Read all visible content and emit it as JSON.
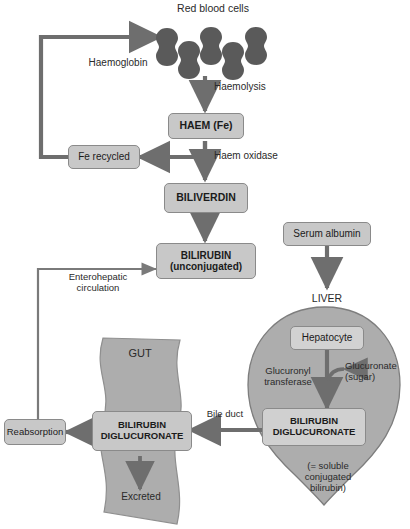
{
  "diagram": {
    "colors": {
      "background": "#ffffff",
      "box_fill": "#c8c8c8",
      "box_border": "#8a8a8a",
      "organ_fill": "#adadad",
      "organ_border": "#7d7d7d",
      "cell_fill": "#5a5a5a",
      "arrow": "#6e6e6e",
      "text": "#1b1b1b"
    },
    "cells": {
      "label": "Red blood cells",
      "count": 5,
      "icon": "red-blood-cell-icon"
    },
    "boxes": [
      {
        "id": "haem",
        "label": "HAEM (Fe)",
        "bold": true
      },
      {
        "id": "fe-recycled",
        "label": "Fe recycled",
        "bold": false
      },
      {
        "id": "biliverdin",
        "label": "BILIVERDIN",
        "bold": true
      },
      {
        "id": "bilirubin-unconjugated",
        "label": "BILIRUBIN\n(unconjugated)",
        "bold": true
      },
      {
        "id": "serum-albumin",
        "label": "Serum albumin",
        "bold": false
      },
      {
        "id": "hepatocyte",
        "label": "Hepatocyte",
        "bold": false
      },
      {
        "id": "bilirubin-diglucuronate-liver",
        "label": "BILIRUBIN\nDIGLUCURONATE",
        "bold": true
      },
      {
        "id": "bilirubin-diglucuronate-gut",
        "label": "BILIRUBIN\nDIGLUCURONATE",
        "bold": true
      },
      {
        "id": "reabsorption",
        "label": "Reabsorption",
        "bold": false
      }
    ],
    "labels": {
      "haemoglobin": "Haemoglobin",
      "haemolysis": "Haemolysis",
      "haem_oxidase": "Haem oxidase",
      "enterohepatic": "Enterohepatic\ncirculation",
      "liver": "LIVER",
      "gut": "GUT",
      "glucuronyl_transferase": "Glucuronyl\ntransferase",
      "glucuronate": "Glucuronate\n(sugar)",
      "soluble_note": "(= soluble\nconjugated\nbilirubin)",
      "bile_duct": "Bile duct",
      "excreted": "Excreted"
    }
  }
}
